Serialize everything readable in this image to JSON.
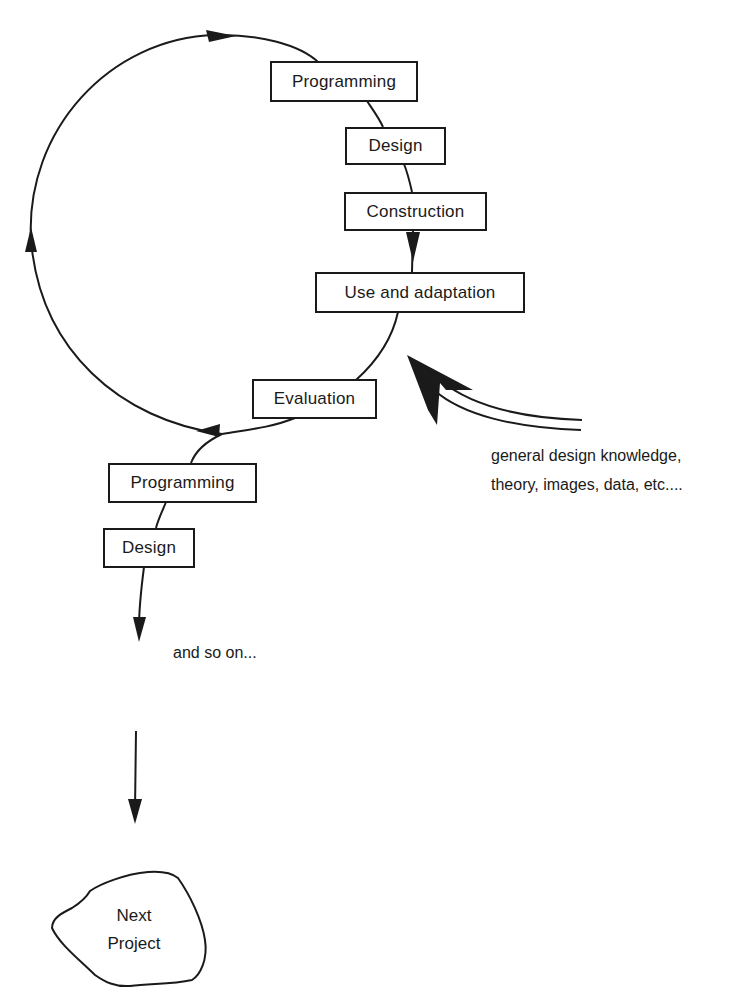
{
  "diagram": {
    "type": "cyclic design process",
    "cycle_steps": [
      {
        "id": "programming",
        "label": "Programming"
      },
      {
        "id": "design",
        "label": "Design"
      },
      {
        "id": "construction",
        "label": "Construction"
      },
      {
        "id": "use",
        "label": "Use and adaptation"
      },
      {
        "id": "evaluation",
        "label": "Evaluation"
      }
    ],
    "next_steps": [
      {
        "id": "programming2",
        "label": "Programming"
      },
      {
        "id": "design2",
        "label": "Design"
      }
    ],
    "continuation_label": "and so on...",
    "input_label_lines": [
      "general design knowledge,",
      "theory, images, data, etc...."
    ],
    "end_node": {
      "lines": [
        "Next",
        "Project"
      ]
    },
    "edges": [
      [
        "programming",
        "design"
      ],
      [
        "design",
        "construction"
      ],
      [
        "construction",
        "use"
      ],
      [
        "use",
        "evaluation"
      ],
      [
        "evaluation",
        "programming"
      ],
      [
        "evaluation",
        "programming2"
      ],
      [
        "programming2",
        "design2"
      ],
      [
        "design2",
        "and so on..."
      ],
      [
        "and so on...",
        "Next Project"
      ],
      [
        "general design knowledge",
        "use"
      ]
    ],
    "colors": {
      "ink": "#1a1a1a",
      "background": "#ffffff"
    }
  }
}
